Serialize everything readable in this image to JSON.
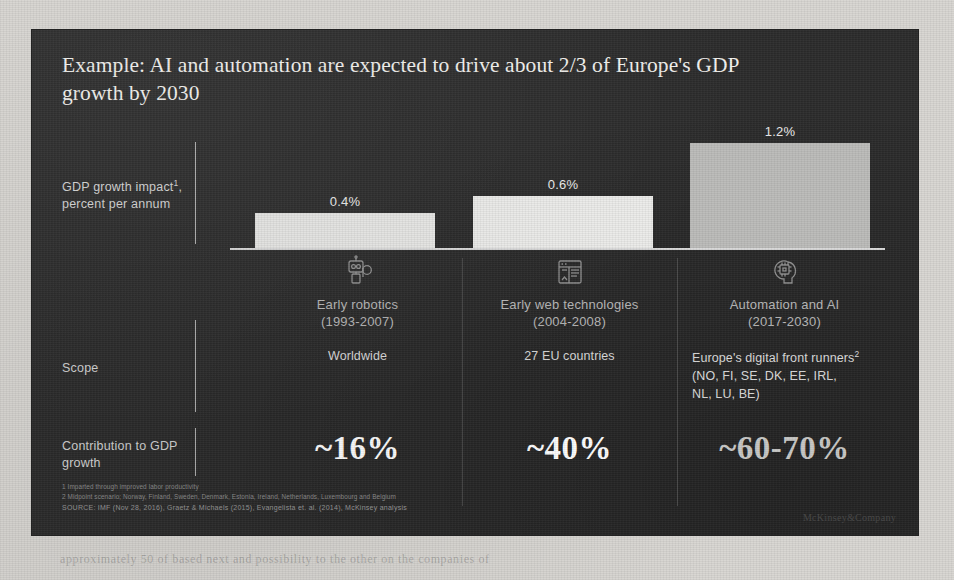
{
  "page": {
    "ghost_top": "",
    "ghost_bottom": "approximately 50 of based next and possibility to the other on the companies of"
  },
  "slide": {
    "title": "Example: AI and automation are expected to drive about 2/3 of Europe's GDP growth by 2030",
    "brand": "McKinsey&Company",
    "row_labels": {
      "gdp_growth": "GDP growth impact¹, percent per annum",
      "scope": "Scope",
      "contribution": "Contribution to GDP growth"
    },
    "footnotes": [
      "1 Imparted through improved labor productivity",
      "2 Midpoint scenario; Norway, Finland, Sweden, Denmark, Estonia, Ireland, Netherlands, Luxembourg and Belgium"
    ],
    "source": "SOURCE: IMF (Nov 28, 2016), Graetz & Michaels (2015), Evangelista et. al. (2014), McKinsey analysis",
    "columns": [
      {
        "icon": "robot-icon",
        "name": "Early robotics",
        "period": "(1993-2007)",
        "bar_label": "0.4%",
        "bar_value": 0.4,
        "bar_color": "#e8e8e6",
        "scope": "Worldwide",
        "scope_align": "center",
        "contribution": "~16%",
        "contribution_color": "#ffffff"
      },
      {
        "icon": "web-browser-icon",
        "name": "Early web technologies",
        "period": "(2004-2008)",
        "bar_label": "0.6%",
        "bar_value": 0.6,
        "bar_color": "#ececea",
        "scope": "27 EU countries",
        "scope_align": "center",
        "contribution": "~40%",
        "contribution_color": "#ffffff"
      },
      {
        "icon": "ai-brain-chip-icon",
        "name": "Automation and AI",
        "period": "(2017-2030)",
        "bar_label": "1.2%",
        "bar_value": 1.2,
        "bar_color": "#bdbdbb",
        "scope": "Europe's digital front runners² (NO, FI, SE, DK, EE, IRL, NL, LU, BE)",
        "scope_align": "left",
        "contribution": "~60-70%",
        "contribution_color": "#c8c8c6"
      }
    ]
  },
  "chart_data": {
    "type": "bar",
    "categories": [
      "Early robotics (1993-2007)",
      "Early web technologies (2004-2008)",
      "Automation and AI (2017-2030)"
    ],
    "values": [
      0.4,
      0.6,
      1.2
    ],
    "data_labels": [
      "0.4%",
      "0.6%",
      "1.2%"
    ],
    "xlabel": "",
    "ylabel": "GDP growth impact, percent per annum",
    "ylim": [
      0,
      1.35
    ],
    "grid": false,
    "legend": "none",
    "series_colors": [
      "#e8e8e6",
      "#ececea",
      "#bdbdbb"
    ],
    "annotations": [
      {
        "category": "Early robotics (1993-2007)",
        "scope": "Worldwide",
        "contribution_to_gdp_growth": "~16%"
      },
      {
        "category": "Early web technologies (2004-2008)",
        "scope": "27 EU countries",
        "contribution_to_gdp_growth": "~40%"
      },
      {
        "category": "Automation and AI (2017-2030)",
        "scope": "Europe's digital front runners (NO, FI, SE, DK, EE, IRL, NL, LU, BE)",
        "contribution_to_gdp_growth": "~60-70%"
      }
    ]
  }
}
